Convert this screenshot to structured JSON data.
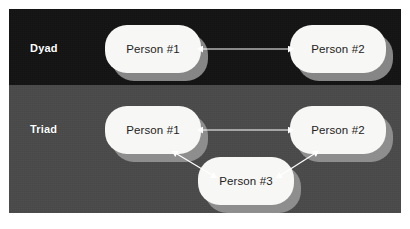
{
  "figure": {
    "panel": {
      "background_dark": "#131313",
      "background_gray": "#4a4a4a",
      "node_fill": "#f7f7f5",
      "node_shadow": "#9a9a9a",
      "connector_color": "#ffffff",
      "label_color": "#ffffff",
      "node_text_color": "#232323"
    },
    "rows": [
      {
        "id": "dyad",
        "label": "Dyad",
        "nodes": [
          {
            "id": "dyad-p1",
            "label": "Person #1"
          },
          {
            "id": "dyad-p2",
            "label": "Person #2"
          }
        ],
        "connections": [
          {
            "from": "dyad-p1",
            "to": "dyad-p2",
            "style": "double-arrow"
          }
        ]
      },
      {
        "id": "triad",
        "label": "Triad",
        "nodes": [
          {
            "id": "triad-p1",
            "label": "Person #1"
          },
          {
            "id": "triad-p2",
            "label": "Person #2"
          },
          {
            "id": "triad-p3",
            "label": "Person #3"
          }
        ],
        "connections": [
          {
            "from": "triad-p1",
            "to": "triad-p2",
            "style": "double-arrow"
          },
          {
            "from": "triad-p1",
            "to": "triad-p3",
            "style": "double-arrow"
          },
          {
            "from": "triad-p3",
            "to": "triad-p2",
            "style": "double-arrow"
          }
        ]
      }
    ]
  }
}
